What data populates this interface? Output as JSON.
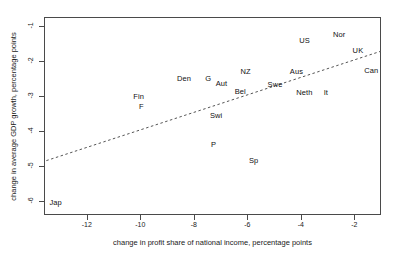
{
  "chart_data": {
    "type": "scatter",
    "title": "",
    "xlabel": "change in profit share of national income, percentage points",
    "ylabel": "change in average GDP growth, percentage points",
    "xlim": [
      -13.6,
      -1.0
    ],
    "ylim": [
      -6.4,
      -0.75
    ],
    "xticks": [
      -12,
      -10,
      -8,
      -6,
      -4,
      -2
    ],
    "xtick_labels": [
      "-12",
      "-10",
      "-8",
      "-6",
      "-4",
      "-2"
    ],
    "yticks": [
      -1,
      -2,
      -3,
      -4,
      -5,
      -6
    ],
    "ytick_labels": [
      "-1",
      "-2",
      "-3",
      "-4",
      "-5",
      "-6"
    ],
    "grid": false,
    "legend": null,
    "marker_style": "text-label-only",
    "points": [
      {
        "label": "Nor",
        "x": -2.6,
        "y": -1.2
      },
      {
        "label": "US",
        "x": -3.9,
        "y": -1.38
      },
      {
        "label": "UK",
        "x": -1.9,
        "y": -1.66
      },
      {
        "label": "Can",
        "x": -1.4,
        "y": -2.22
      },
      {
        "label": "NZ",
        "x": -6.1,
        "y": -2.26
      },
      {
        "label": "Aus",
        "x": -4.2,
        "y": -2.26
      },
      {
        "label": "Den",
        "x": -8.4,
        "y": -2.47
      },
      {
        "label": "G",
        "x": -7.5,
        "y": -2.47
      },
      {
        "label": "Aut",
        "x": -7.0,
        "y": -2.6
      },
      {
        "label": "Swe",
        "x": -5.0,
        "y": -2.63
      },
      {
        "label": "Bel",
        "x": -6.3,
        "y": -2.83
      },
      {
        "label": "Neth",
        "x": -3.9,
        "y": -2.86
      },
      {
        "label": "It",
        "x": -3.1,
        "y": -2.86
      },
      {
        "label": "Fin",
        "x": -10.1,
        "y": -2.97
      },
      {
        "label": "F",
        "x": -10.0,
        "y": -3.27
      },
      {
        "label": "Swi",
        "x": -7.2,
        "y": -3.52
      },
      {
        "label": "P",
        "x": -7.3,
        "y": -4.35
      },
      {
        "label": "Sp",
        "x": -5.8,
        "y": -4.8
      },
      {
        "label": "Jap",
        "x": -13.2,
        "y": -6.0
      }
    ],
    "trend_line": {
      "style": "dashed",
      "x_start": -13.55,
      "y_start": -4.82,
      "x_end": -1.05,
      "y_end": -1.7
    }
  },
  "colors": {
    "frame": "#4a4a4a",
    "text": "#1a1a1a",
    "point_label": "#111111",
    "trend": "#555555",
    "background": "#ffffff"
  }
}
